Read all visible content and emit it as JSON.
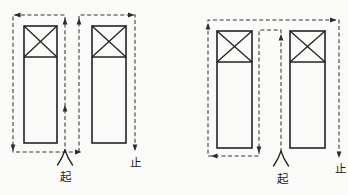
{
  "figure": {
    "background_color": "#fafaf8",
    "line_color": "#2b2b2b",
    "left_diagram": {
      "start_label": "起",
      "end_label": "止"
    },
    "right_diagram": {
      "start_label": "起",
      "end_label": "止"
    }
  }
}
